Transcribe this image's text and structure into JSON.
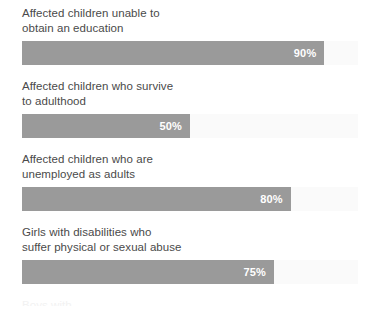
{
  "chart_data": {
    "type": "bar",
    "title": "",
    "xlabel": "",
    "ylabel": "",
    "xlim": [
      0,
      100
    ],
    "grid": false,
    "legend": null,
    "orientation": "horizontal",
    "value_suffix": "%",
    "bar_color": "#9a9a9a",
    "track_color": "#fafafa",
    "categories": [
      "Affected children unable to obtain an education",
      "Affected children who survive to adulthood",
      "Affected children who are unemployed as adults",
      "Girls with disabilities who suffer physical or sexual abuse"
    ],
    "values": [
      90,
      50,
      80,
      75
    ],
    "value_labels": [
      "90%",
      "50%",
      "80%",
      "75%"
    ]
  },
  "bars": [
    {
      "label": "Affected children unable to\nobtain an education",
      "value": 90,
      "value_label": "90%"
    },
    {
      "label": "Affected children who survive\nto adulthood",
      "value": 50,
      "value_label": "50%"
    },
    {
      "label": "Affected children who are\nunemployed as adults",
      "value": 80,
      "value_label": "80%"
    },
    {
      "label": "Girls with disabilities who\nsuffer physical or sexual abuse",
      "value": 75,
      "value_label": "75%"
    }
  ],
  "cut_off": {
    "label": "Boys with"
  }
}
